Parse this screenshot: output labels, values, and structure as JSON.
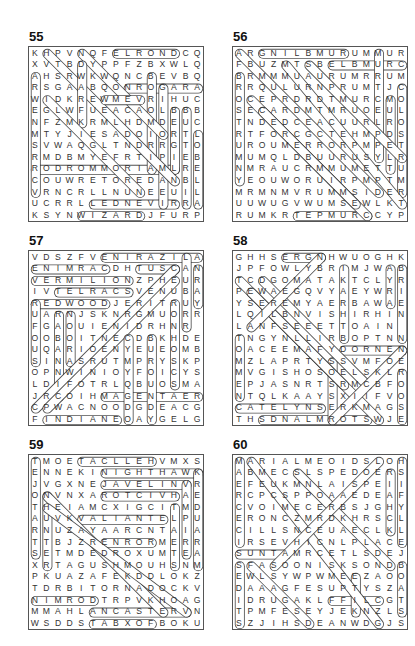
{
  "puzzles": [
    {
      "number": "55",
      "rows": [
        "KHPVNQFELRONDCQ",
        "XVTBDYPPFZBXWLQ",
        "AHSRWKWQNCBEVBQ",
        "RSGAABQONROGARA",
        "WIDKREWMEVRIHUC",
        "EGLWFUEACAOLBBB",
        "NFZMKRMLHDMDEUC",
        "MTYJIESADOIORTL",
        "SVWAQGLTNDRRGTO",
        "RMDBMYEFRTIPIEB",
        "RODROMMORIAMLRE",
        "COUWRETOREDANBL",
        "VRNCRLLNUNEEUIL",
        "UCRRLLEDNEVIRRA",
        "KSYNWIZARDJFURP"
      ],
      "words": [
        {
          "r1": 0,
          "c1": 7,
          "r2": 0,
          "c2": 12
        },
        {
          "r1": 3,
          "c1": 8,
          "r2": 3,
          "c2": 14
        },
        {
          "r1": 14,
          "c1": 4,
          "r2": 14,
          "c2": 9
        },
        {
          "r1": 10,
          "c1": 0,
          "r2": 10,
          "c2": 12
        },
        {
          "r1": 13,
          "c1": 5,
          "r2": 13,
          "c2": 12
        },
        {
          "r1": 2,
          "c1": 0,
          "r2": 12,
          "c2": 0
        },
        {
          "r1": 2,
          "c1": 10,
          "r2": 10,
          "c2": 10
        },
        {
          "r1": 3,
          "c1": 11,
          "r2": 13,
          "c2": 11
        },
        {
          "r1": 5,
          "c1": 12,
          "r2": 10,
          "c2": 12
        },
        {
          "r1": 5,
          "c1": 13,
          "r2": 13,
          "c2": 13
        },
        {
          "r1": 7,
          "c1": 14,
          "r2": 13,
          "c2": 14
        },
        {
          "r1": 0,
          "c1": 1,
          "r2": 11,
          "c2": 12
        },
        {
          "r1": 0,
          "c1": 4,
          "r2": 7,
          "c2": 11
        },
        {
          "r1": 1,
          "c1": 4,
          "r2": 6,
          "c2": 4
        },
        {
          "r1": 4,
          "c1": 1,
          "r2": 12,
          "c2": 9
        },
        {
          "r1": 4,
          "c1": 6,
          "r2": 4,
          "c2": 9
        }
      ]
    },
    {
      "number": "56",
      "rows": [
        "ARGNILBMURUMMUR",
        "FBUZMTSBELBMURC",
        "BRMMMUAURUMRRUM",
        "RRQULURNPRUMTJC",
        "OCEPRDRDTMURCMO",
        "SECARDMTMRUOEUL",
        "TNDEDCEACUURLRO",
        "RTFORCGCTEHMPDS",
        "UROUMERRORPMPET",
        "MUMQLDBUURUSYLR",
        "NMRAUCRMMUMETTU",
        "YEOUWORUIRPMPTM",
        "MRMNMVRUMMSIDER",
        "UUWUGVWUMSEWLKT",
        "RUMKRTEPMURCCYP"
      ],
      "words": [
        {
          "r1": 0,
          "c1": 2,
          "r2": 0,
          "c2": 9
        },
        {
          "r1": 1,
          "c1": 8,
          "r2": 1,
          "c2": 14
        },
        {
          "r1": 14,
          "c1": 5,
          "r2": 14,
          "c2": 11
        },
        {
          "r1": 0,
          "c1": 12,
          "r2": 9,
          "c2": 12
        },
        {
          "r1": 3,
          "c1": 14,
          "r2": 12,
          "c2": 14
        },
        {
          "r1": 4,
          "c1": 13,
          "r2": 10,
          "c2": 13
        },
        {
          "r1": 2,
          "c1": 0,
          "r2": 11,
          "c2": 0
        },
        {
          "r1": 0,
          "c1": 0,
          "r2": 12,
          "c2": 12
        },
        {
          "r1": 1,
          "c1": 4,
          "r2": 13,
          "c2": 14
        },
        {
          "r1": 1,
          "c1": 6,
          "r2": 9,
          "c2": 14
        },
        {
          "r1": 4,
          "c1": 1,
          "r2": 14,
          "c2": 11
        },
        {
          "r1": 5,
          "c1": 2,
          "r2": 13,
          "c2": 10
        }
      ]
    },
    {
      "number": "57",
      "rows": [
        "VDSZFVENIRAZILA",
        "ENIMRACDHTUSCAN",
        "VERMILIONZPHEUR",
        "IVTELRACSVENUBA",
        "REDWOODJERITRUY",
        "UARNJSKNRGMUORR",
        "FGAOUIENIDRHNR",
        "OOBOITNECDBKHDE",
        "UQARIOENYEUEOMB",
        "SINASRUTMPRYSKP",
        "OPNWINIOYFOICYS",
        "LDIFOTRLQBUOSMA",
        "JRCOIHMAGENTAER",
        "CPWACNOODGDEACG",
        "FINDIANEOAYGELG"
      ],
      "words": [
        {
          "r1": 0,
          "c1": 6,
          "r2": 0,
          "c2": 14
        },
        {
          "r1": 1,
          "c1": 0,
          "r2": 1,
          "c2": 6
        },
        {
          "r1": 1,
          "c1": 9,
          "r2": 1,
          "c2": 12
        },
        {
          "r1": 2,
          "c1": 0,
          "r2": 2,
          "c2": 8
        },
        {
          "r1": 3,
          "c1": 2,
          "r2": 3,
          "c2": 8
        },
        {
          "r1": 4,
          "c1": 0,
          "r2": 4,
          "c2": 6
        },
        {
          "r1": 12,
          "c1": 6,
          "r2": 12,
          "c2": 14
        },
        {
          "r1": 14,
          "c1": 1,
          "r2": 14,
          "c2": 7
        },
        {
          "r1": 0,
          "c1": 13,
          "r2": 6,
          "c2": 13
        },
        {
          "r1": 1,
          "c1": 14,
          "r2": 4,
          "c2": 14
        },
        {
          "r1": 4,
          "c1": 0,
          "r2": 9,
          "c2": 0
        },
        {
          "r1": 5,
          "c1": 2,
          "r2": 12,
          "c2": 2
        },
        {
          "r1": 5,
          "c1": 3,
          "r2": 9,
          "c2": 3
        },
        {
          "r1": 4,
          "c1": 12,
          "r2": 11,
          "c2": 12
        },
        {
          "r1": 7,
          "c1": 10,
          "r2": 14,
          "c2": 10
        },
        {
          "r1": 1,
          "c1": 12,
          "r2": 13,
          "c2": 0
        },
        {
          "r1": 2,
          "c1": 12,
          "r2": 13,
          "c2": 1
        },
        {
          "r1": 7,
          "c1": 8,
          "r2": 14,
          "c2": 8
        }
      ]
    },
    {
      "number": "58",
      "rows": [
        "GHHSERGNHWUOGHK",
        "JPFOWLYBRIMJWAB",
        "TCDGOMATAKTCLYR",
        "PEWAEGQVYAEYWRI",
        "YSEREMYAERBAWAE",
        "LQILBNVISHIRHIN",
        "LANFSEEETTOAIN",
        "TNGYNLLIRBOPTNNE",
        "OACEEMAFYDORNEN",
        "MZLAPRTYSSVMFOE",
        "MVGISHOSOELSKLR",
        "EPJASNRTSRMCBFO",
        "NTQLKAAYSXIIFVO",
        "CATELYNSERKMAGS",
        "THSDNALMROTSWJE"
      ],
      "words": [
        {
          "r1": 0,
          "c1": 4,
          "r2": 0,
          "c2": 7
        },
        {
          "r1": 8,
          "c1": 9,
          "r2": 8,
          "c2": 14
        },
        {
          "r1": 13,
          "c1": 0,
          "r2": 13,
          "c2": 7
        },
        {
          "r1": 14,
          "c1": 2,
          "r2": 14,
          "c2": 11
        },
        {
          "r1": 1,
          "c1": 13,
          "r2": 4,
          "c2": 13
        },
        {
          "r1": 1,
          "c1": 14,
          "r2": 7,
          "c2": 14
        },
        {
          "r1": 10,
          "c1": 14,
          "r2": 14,
          "c2": 14
        },
        {
          "r1": 7,
          "c1": 0,
          "r2": 12,
          "c2": 0
        },
        {
          "r1": 1,
          "c1": 9,
          "r2": 7,
          "c2": 9
        },
        {
          "r1": 9,
          "c1": 8,
          "r2": 14,
          "c2": 8
        },
        {
          "r1": 2,
          "c1": 0,
          "r2": 14,
          "c2": 12
        },
        {
          "r1": 2,
          "c1": 2,
          "r2": 11,
          "c2": 11
        },
        {
          "r1": 3,
          "c1": 1,
          "r2": 11,
          "c2": 9
        },
        {
          "r1": 0,
          "c1": 7,
          "r2": 6,
          "c2": 1
        },
        {
          "r1": 8,
          "c1": 14,
          "r2": 14,
          "c2": 8
        }
      ]
    },
    {
      "number": "59",
      "rows": [
        "TMOETACLLEHVMXS",
        "ENNEKINIGHTHAWK",
        "JVGXNEJAVELINVR",
        "ONVNXAROTCIVHAE",
        "THEIAMCXIGCITMD",
        "AUVKVALIANTELPU",
        "RNUZAYAARCNTAIA",
        "TTBJZRENRORMERR",
        "SETMDEDROXUMTEA",
        "XRTAGUSHMOUHSNM",
        "PKUAZAFEKDDLOKZ",
        "TDRBITORNADOCKV",
        "NIMRODTRPVKHOAG",
        "MMAHLANCASTERVN",
        "WSDDSTABXOFBOKU"
      ],
      "words": [
        {
          "r1": 0,
          "c1": 4,
          "r2": 0,
          "c2": 10
        },
        {
          "r1": 1,
          "c1": 6,
          "r2": 1,
          "c2": 14
        },
        {
          "r1": 2,
          "c1": 6,
          "r2": 2,
          "c2": 13
        },
        {
          "r1": 3,
          "c1": 6,
          "r2": 3,
          "c2": 12
        },
        {
          "r1": 5,
          "c1": 4,
          "r2": 5,
          "c2": 11
        },
        {
          "r1": 7,
          "c1": 6,
          "r2": 7,
          "c2": 10
        },
        {
          "r1": 12,
          "c1": 0,
          "r2": 12,
          "c2": 5
        },
        {
          "r1": 13,
          "c1": 5,
          "r2": 13,
          "c2": 13
        },
        {
          "r1": 14,
          "c1": 5,
          "r2": 14,
          "c2": 10
        },
        {
          "r1": 0,
          "c1": 0,
          "r2": 8,
          "c2": 0
        },
        {
          "r1": 2,
          "c1": 13,
          "r2": 8,
          "c2": 13
        },
        {
          "r1": 1,
          "c1": 14,
          "r2": 9,
          "c2": 14
        },
        {
          "r1": 4,
          "c1": 12,
          "r2": 9,
          "c2": 12
        },
        {
          "r1": 3,
          "c1": 1,
          "r2": 9,
          "c2": 1
        },
        {
          "r1": 3,
          "c1": 1,
          "r2": 13,
          "c2": 11
        },
        {
          "r1": 4,
          "c1": 1,
          "r2": 13,
          "c2": 13
        }
      ]
    },
    {
      "number": "60",
      "rows": [
        "MARIALMEOIDSLOH",
        "ABMECSLSPEDOERS",
        "EFEUKMNLAISPEII",
        "RCPCSPPOAAEDEAF",
        "CVOIMECERBSJGHY",
        "ERONCZMRDKHRSCL",
        "CILLSNCEUAECLKL",
        "IRSEVHICNLPLACE",
        "SUNTAMRCETLSDEJ",
        "SFASOONISKSONDB",
        "EWLSYWPWMEEZAOO",
        "DAAAGFESUPTYSZA",
        "IDRUGAKLFFILCGT",
        "TPMFESEYJEKNZLS",
        "SZJIHSDEANWDGJS"
      ],
      "words": [
        {
          "r1": 0,
          "c1": 0,
          "r2": 7,
          "c2": 0
        },
        {
          "r1": 0,
          "c1": 14,
          "r2": 7,
          "c2": 14
        },
        {
          "r1": 1,
          "c1": 13,
          "r2": 6,
          "c2": 13
        },
        {
          "r1": 8,
          "c1": 0,
          "r2": 8,
          "c2": 4
        },
        {
          "r1": 9,
          "c1": 0,
          "r2": 14,
          "c2": 0
        },
        {
          "r1": 9,
          "c1": 14,
          "r2": 13,
          "c2": 14
        },
        {
          "r1": 12,
          "c1": 8,
          "r2": 12,
          "c2": 12
        },
        {
          "r1": 10,
          "c1": 10,
          "r2": 13,
          "c2": 10
        },
        {
          "r1": 0,
          "c1": 1,
          "r2": 14,
          "c2": 12
        },
        {
          "r1": 1,
          "c1": 5,
          "r2": 9,
          "c2": 13
        },
        {
          "r1": 0,
          "c1": 12,
          "r2": 9,
          "c2": 3
        },
        {
          "r1": 9,
          "c1": 1,
          "r2": 14,
          "c2": 6
        }
      ]
    }
  ]
}
